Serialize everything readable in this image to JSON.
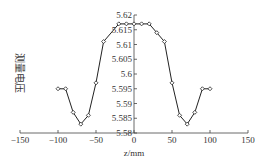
{
  "chart_data": {
    "type": "line",
    "title": "",
    "xlabel": "z/mm",
    "ylabel": "测量电压",
    "xlim": [
      -150,
      150
    ],
    "ylim": [
      5.58,
      5.62
    ],
    "xticks": [
      -150,
      -100,
      -50,
      0,
      50,
      100,
      150
    ],
    "xtick_labels": [
      "−150",
      "−100",
      "−50",
      "0",
      "50",
      "100",
      "150"
    ],
    "yticks": [
      5.58,
      5.585,
      5.59,
      5.595,
      5.6,
      5.605,
      5.61,
      5.615,
      5.62
    ],
    "ytick_labels": [
      "5.58",
      "5.585",
      "5.59",
      "5.595",
      "5.6",
      "5.605",
      "5.61",
      "5.615",
      "5.62"
    ],
    "grid": false,
    "legend": null,
    "series": [
      {
        "name": "测量电压",
        "marker": "diamond",
        "x": [
          -100,
          -90,
          -80,
          -70,
          -60,
          -50,
          -40,
          -20,
          -10,
          0,
          10,
          20,
          30,
          40,
          50,
          60,
          70,
          80,
          90,
          100
        ],
        "values": [
          5.595,
          5.595,
          5.587,
          5.583,
          5.586,
          5.597,
          5.611,
          5.617,
          5.617,
          5.617,
          5.617,
          5.617,
          5.614,
          5.611,
          5.597,
          5.586,
          5.583,
          5.587,
          5.595,
          5.595
        ]
      }
    ]
  }
}
